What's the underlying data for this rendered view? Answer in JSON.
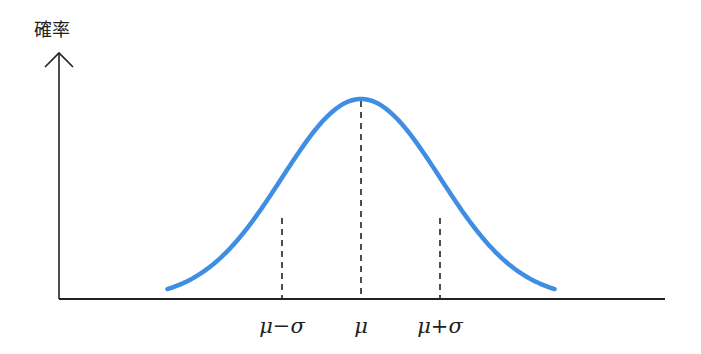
{
  "chart_data": {
    "type": "line",
    "title": "",
    "ylabel": "確率",
    "xlabel": "",
    "tick_labels": [
      "μ−σ",
      "μ",
      "μ+σ"
    ],
    "reference_lines": [
      {
        "label": "μ−σ",
        "x": -1,
        "style": "dashed"
      },
      {
        "label": "μ",
        "x": 0,
        "style": "dashed"
      },
      {
        "label": "μ+σ",
        "x": 1,
        "style": "dashed"
      }
    ],
    "series": [
      {
        "name": "normal-distribution",
        "x_range_sigma": [
          -2.45,
          2.45
        ],
        "mean": 0,
        "sd": 1,
        "color": "#3f8ee4"
      }
    ],
    "grid": false,
    "legend": null
  },
  "axis": {
    "y_label": "確率",
    "labels": {
      "minus_sigma": "μ−σ",
      "mu": "μ",
      "plus_sigma": "μ+σ"
    }
  },
  "colors": {
    "curve": "#3f8ee4",
    "axis": "#222222",
    "dashed": "#222222"
  }
}
